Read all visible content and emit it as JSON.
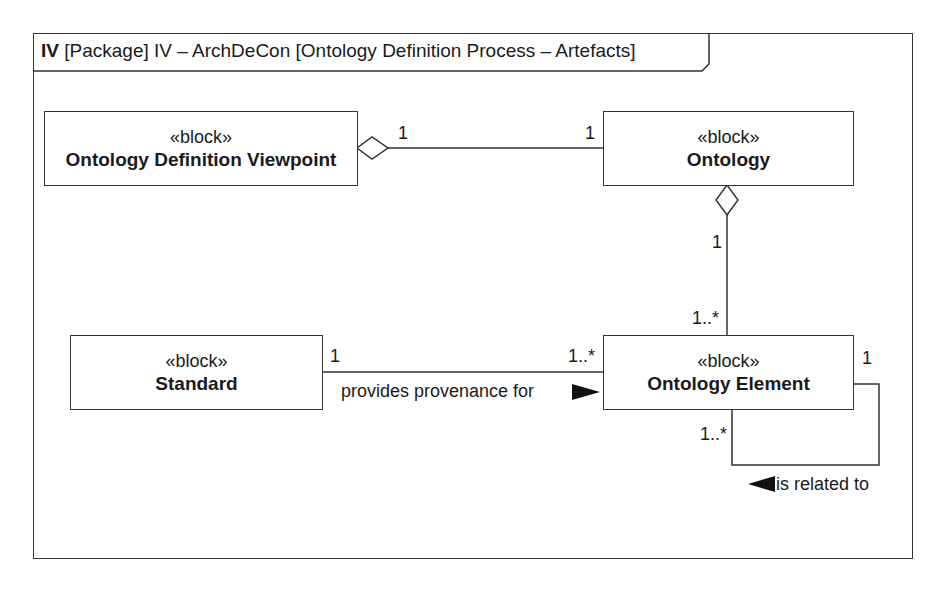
{
  "frame": {
    "kind": "IV",
    "title": "[Package] IV – ArchDeCon [Ontology Definition Process – Artefacts]"
  },
  "blocks": [
    {
      "id": "odv",
      "stereotype": "«block»",
      "name": "Ontology Definition Viewpoint"
    },
    {
      "id": "ontology",
      "stereotype": "«block»",
      "name": "Ontology"
    },
    {
      "id": "standard",
      "stereotype": "«block»",
      "name": "Standard"
    },
    {
      "id": "element",
      "stereotype": "«block»",
      "name": "Ontology Element"
    }
  ],
  "relationships": [
    {
      "type": "aggregation",
      "from": "Ontology Definition Viewpoint",
      "to": "Ontology",
      "mult_from": "1",
      "mult_to": "1"
    },
    {
      "type": "aggregation",
      "from": "Ontology",
      "to": "Ontology Element",
      "mult_from": "1",
      "mult_to": "1..*"
    },
    {
      "type": "association",
      "from": "Standard",
      "to": "Ontology Element",
      "mult_from": "1",
      "mult_to": "1..*",
      "label": "provides provenance for"
    },
    {
      "type": "association",
      "from": "Ontology Element",
      "to": "Ontology Element",
      "mult_from": "1",
      "mult_to": "1..*",
      "label": "is related to"
    }
  ]
}
